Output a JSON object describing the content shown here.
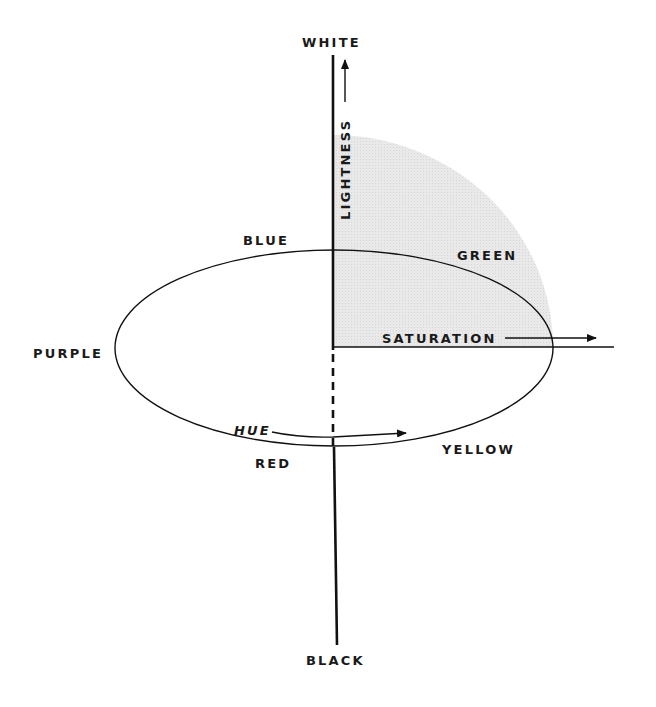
{
  "diagram": {
    "type": "color-solid-model",
    "labels": {
      "top": "WHITE",
      "bottom": "BLACK",
      "left": "PURPLE",
      "blue": "BLUE",
      "green": "GREEN",
      "yellow": "YELLOW",
      "red": "RED"
    },
    "dimensions": {
      "lightness": "LIGHTNESS",
      "saturation": "SATURATION",
      "hue": "HUE"
    },
    "colors": {
      "line": "#111111",
      "text": "#1a1a1a",
      "shading": "#e6e6e6",
      "background": "#ffffff"
    }
  }
}
